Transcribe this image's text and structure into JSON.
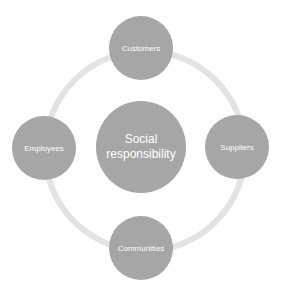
{
  "diagram": {
    "center": {
      "label": "Social responsibility",
      "line1": "Social",
      "line2": "responsibility"
    },
    "nodes": [
      {
        "label": "Customers",
        "position": "top"
      },
      {
        "label": "Suppliers",
        "position": "right"
      },
      {
        "label": "Communities",
        "position": "bottom"
      },
      {
        "label": "Employees",
        "position": "left"
      }
    ],
    "colors": {
      "node_fill": "#a6a6a6",
      "ring": "#e3e3e3",
      "text": "#ffffff"
    }
  }
}
